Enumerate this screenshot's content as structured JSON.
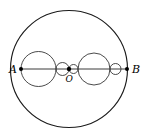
{
  "figure": {
    "kind": "geometry-diagram",
    "canvas": {
      "width": 148,
      "height": 135,
      "background": "#ffffff"
    },
    "colors": {
      "outline": "#1a1a1a",
      "inner_outline": "#2a2a2a",
      "diameter": "#3a3a3a",
      "dot": "#000000",
      "label": "#000000"
    },
    "outer_circle": {
      "cx": 69,
      "cy": 69,
      "r": 58.5
    },
    "diameter": {
      "x1": 21,
      "y1": 69,
      "x2": 127,
      "y2": 69
    },
    "inner_circles": [
      {
        "name": "circle-1",
        "cx": 38.5,
        "cy": 69,
        "r": 17.5
      },
      {
        "name": "circle-2",
        "cx": 62.5,
        "cy": 69,
        "r": 6.5
      },
      {
        "name": "circle-3",
        "cx": 73.5,
        "cy": 69,
        "r": 4.5
      },
      {
        "name": "circle-4",
        "cx": 94.0,
        "cy": 69,
        "r": 16.0
      },
      {
        "name": "circle-5",
        "cx": 115.5,
        "cy": 69,
        "r": 5.5
      }
    ],
    "points": [
      {
        "name": "point-a",
        "label": "A",
        "cx": 21,
        "cy": 69,
        "r": 2.0,
        "label_x": 9,
        "label_y": 72.5
      },
      {
        "name": "point-o",
        "label": "O",
        "cx": 69,
        "cy": 69,
        "r": 2.2,
        "label_x": 65.5,
        "label_y": 82
      },
      {
        "name": "point-b",
        "label": "B",
        "cx": 127,
        "cy": 69,
        "r": 2.0,
        "label_x": 132,
        "label_y": 72.5
      }
    ]
  }
}
